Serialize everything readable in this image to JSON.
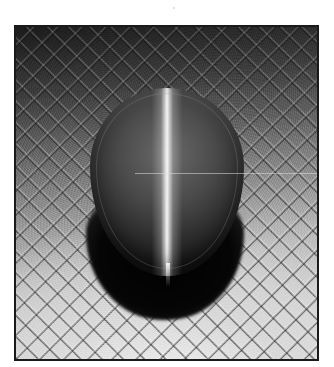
{
  "image": {
    "subject": "cat's-eye gemstone cabochon on crosshatched textured surface",
    "style": "black-and-white photograph",
    "has_text": false
  },
  "colors": {
    "page_background": "#ffffff",
    "frame_border": "#1a1a1a",
    "gem_band": "#ffffff",
    "shadow": "#000000"
  }
}
